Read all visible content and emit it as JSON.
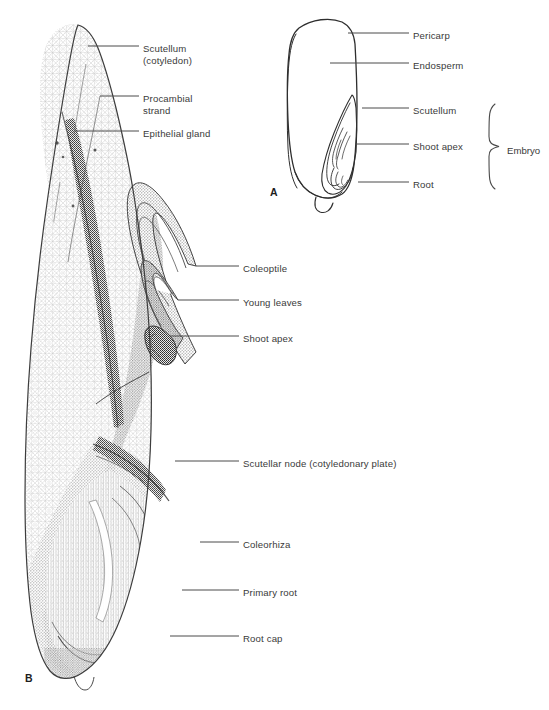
{
  "figure": {
    "background_color": "#ffffff",
    "ink_color": "#3a3a3a",
    "line_color": "#4a4a4a",
    "stipple_color": "#6e6e6e"
  },
  "panels": [
    {
      "id": "panel-a",
      "letter": "A",
      "letter_x": 270,
      "letter_y": 186,
      "description": "outline drawing of grain in longitudinal section",
      "labels": [
        {
          "id": "pericarp",
          "text": "Pericarp",
          "x": 413,
          "y": 30,
          "leader": [
            [
              348,
              33
            ],
            [
              409,
              33
            ]
          ]
        },
        {
          "id": "endosperm",
          "text": "Endosperm",
          "x": 413,
          "y": 60,
          "leader": [
            [
              330,
              63
            ],
            [
              409,
              63
            ]
          ]
        },
        {
          "id": "scutellum",
          "text": "Scutellum",
          "x": 413,
          "y": 105,
          "leader": [
            [
              362,
              108
            ],
            [
              409,
              108
            ]
          ]
        },
        {
          "id": "shoot-apex",
          "text": "Shoot apex",
          "x": 413,
          "y": 141,
          "leader": [
            [
              355,
              144
            ],
            [
              409,
              144
            ]
          ]
        },
        {
          "id": "root",
          "text": "Root",
          "x": 413,
          "y": 179,
          "leader": [
            [
              358,
              182
            ],
            [
              409,
              182
            ]
          ]
        }
      ],
      "brace": {
        "label": "Embryo",
        "label_x": 507,
        "label_y": 145,
        "top_y": 104,
        "bottom_y": 189,
        "x": 489,
        "tip_x": 499
      }
    },
    {
      "id": "panel-b",
      "letter": "B",
      "letter_x": 25,
      "letter_y": 672,
      "description": "stippled histological drawing of grain embryo in longitudinal section",
      "labels": [
        {
          "id": "scutellum-cotyledon",
          "text": "Scutellum",
          "text2": "(cotyledon)",
          "x": 143,
          "y": 43,
          "leader": [
            [
              88,
              46
            ],
            [
              139,
              46
            ]
          ]
        },
        {
          "id": "procambial-strand",
          "text": "Procambial",
          "text2": "strand",
          "x": 143,
          "y": 93,
          "leader": [
            [
              100,
              96
            ],
            [
              139,
              96
            ]
          ]
        },
        {
          "id": "epithelial-gland",
          "text": "Epithelial gland",
          "x": 143,
          "y": 128,
          "leader": [
            [
              75,
              131
            ],
            [
              139,
              131
            ]
          ]
        },
        {
          "id": "coleoptile",
          "text": "Coleoptile",
          "x": 243,
          "y": 263,
          "leader": [
            [
              196,
              266
            ],
            [
              239,
              266
            ]
          ]
        },
        {
          "id": "young-leaves",
          "text": "Young leaves",
          "x": 243,
          "y": 297,
          "leader": [
            [
              178,
              300
            ],
            [
              239,
              300
            ]
          ]
        },
        {
          "id": "shoot-apex-b",
          "text": "Shoot apex",
          "x": 243,
          "y": 333,
          "leader": [
            [
              170,
              336
            ],
            [
              239,
              336
            ]
          ]
        },
        {
          "id": "scutellar-node",
          "text": "Scutellar node (cotyledonary plate)",
          "x": 243,
          "y": 458,
          "leader": [
            [
              175,
              461
            ],
            [
              239,
              461
            ]
          ]
        },
        {
          "id": "coleorhiza",
          "text": "Coleorhiza",
          "x": 243,
          "y": 539,
          "leader": [
            [
              200,
              542
            ],
            [
              239,
              542
            ]
          ]
        },
        {
          "id": "primary-root",
          "text": "Primary root",
          "x": 243,
          "y": 587,
          "leader": [
            [
              182,
              590
            ],
            [
              239,
              590
            ]
          ]
        },
        {
          "id": "root-cap",
          "text": "Root cap",
          "x": 243,
          "y": 633,
          "leader": [
            [
              170,
              636
            ],
            [
              239,
              636
            ]
          ]
        }
      ]
    }
  ]
}
